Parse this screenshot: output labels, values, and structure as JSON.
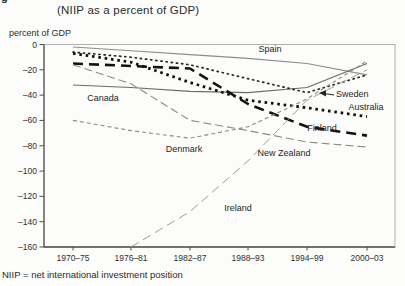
{
  "figure": {
    "caption_fragment": "g",
    "title": "(NIIP as a percent of GDP)",
    "y_axis_label": "percent of GDP",
    "footnote": "NIIP = net international investment position"
  },
  "chart_data": {
    "type": "line",
    "title": "(NIIP as a percent of GDP)",
    "xlabel": "",
    "ylabel": "percent of GDP",
    "ylim": [
      -160,
      0
    ],
    "grid": false,
    "legend_position": "inline-labels",
    "y_ticks": [
      "0",
      "–20",
      "–40",
      "–60",
      "–80",
      "–100",
      "–120",
      "–140",
      "–160"
    ],
    "y_tick_values": [
      0,
      -20,
      -40,
      -60,
      -80,
      -100,
      -120,
      -140,
      -160
    ],
    "categories": [
      "1970–75",
      "1976–81",
      "1982–87",
      "1988–93",
      "1994–99",
      "2000–03"
    ],
    "series": [
      {
        "name": "Spain",
        "values": [
          -2,
          -5,
          -8,
          -11,
          -15,
          -24
        ],
        "style": {
          "color": "#8c8c8c",
          "width": 1.1,
          "dash": "",
          "cap": "butt"
        }
      },
      {
        "name": "Canada",
        "values": [
          -32,
          -34,
          -37,
          -38,
          -34,
          -15
        ],
        "style": {
          "color": "#6b6b6b",
          "width": 1.2,
          "dash": "",
          "cap": "butt"
        }
      },
      {
        "name": "Sweden",
        "values": [
          -6,
          -10,
          -16,
          -27,
          -38,
          -24
        ],
        "style": {
          "color": "#262626",
          "width": 1.7,
          "dash": "1.2 4",
          "cap": "round"
        }
      },
      {
        "name": "Australia",
        "values": [
          -7,
          -14,
          -30,
          -44,
          -50,
          -57
        ],
        "style": {
          "color": "#121212",
          "width": 2.8,
          "dash": "2.6 3.8",
          "cap": "butt"
        }
      },
      {
        "name": "Finland",
        "values": [
          -15,
          -17,
          -19,
          -47,
          -65,
          -72
        ],
        "style": {
          "color": "#121212",
          "width": 2.6,
          "dash": "10 6",
          "cap": "butt"
        }
      },
      {
        "name": "Denmark",
        "values": [
          -60,
          -68,
          -74,
          -65,
          -43,
          -13
        ],
        "style": {
          "color": "#8a8a8a",
          "width": 1.1,
          "dash": "4 3",
          "cap": "butt"
        }
      },
      {
        "name": "New Zealand",
        "values": [
          -16,
          -31,
          -60,
          -68,
          -77,
          -81
        ],
        "style": {
          "color": "#8a8a8a",
          "width": 1.1,
          "dash": "8 4",
          "cap": "butt"
        }
      },
      {
        "name": "Ireland",
        "values": [
          null,
          -160,
          -132,
          -92,
          -44,
          -20
        ],
        "style": {
          "color": "#9c9c9c",
          "width": 1.0,
          "dash": "9 5",
          "cap": "butt"
        }
      }
    ],
    "labels": [
      {
        "text": "Spain",
        "x": 270,
        "y": 52,
        "anchor": "middle"
      },
      {
        "text": "Canada",
        "x": 103,
        "y": 101,
        "anchor": "middle"
      },
      {
        "text": "Sweden",
        "x": 336,
        "y": 97,
        "anchor": "start"
      },
      {
        "text": "Australia",
        "x": 366,
        "y": 110,
        "anchor": "middle"
      },
      {
        "text": "Finland",
        "x": 322,
        "y": 131,
        "anchor": "middle"
      },
      {
        "text": "Denmark",
        "x": 184,
        "y": 152,
        "anchor": "middle"
      },
      {
        "text": "New Zealand",
        "x": 284,
        "y": 156,
        "anchor": "middle"
      },
      {
        "text": "Ireland",
        "x": 238,
        "y": 211,
        "anchor": "middle"
      }
    ],
    "annotation_arrow": {
      "from": [
        334,
        95
      ],
      "to": [
        320,
        93
      ]
    },
    "layout": {
      "plot": [
        44,
        44.5,
        395,
        247
      ],
      "x_positions": [
        73,
        131,
        190,
        248,
        307,
        367
      ],
      "axis_color_dark": "#4f4f4f",
      "axis_color_light": "#b0b0b0"
    }
  }
}
